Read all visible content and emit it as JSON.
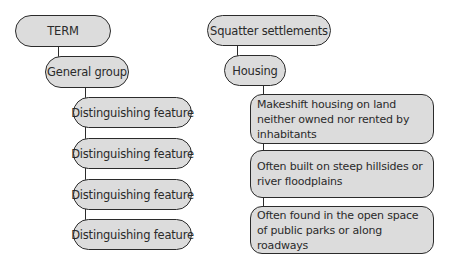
{
  "template": {
    "term": "TERM",
    "general_group": "General group",
    "features": [
      "Distinguishing feature",
      "Distinguishing feature",
      "Distinguishing feature",
      "Distinguishing feature"
    ]
  },
  "example": {
    "term": "Squatter settlements",
    "general_group": "Housing",
    "features": [
      "Makeshift housing on land neither owned nor rented by inhabitants",
      "Often built on steep hillsides or river floodplains",
      "Often found in the open space of public parks or along roadways"
    ]
  },
  "colors": {
    "node_fill": "#dcdcdc",
    "node_border": "#2b2b2b",
    "background": "#ffffff"
  }
}
